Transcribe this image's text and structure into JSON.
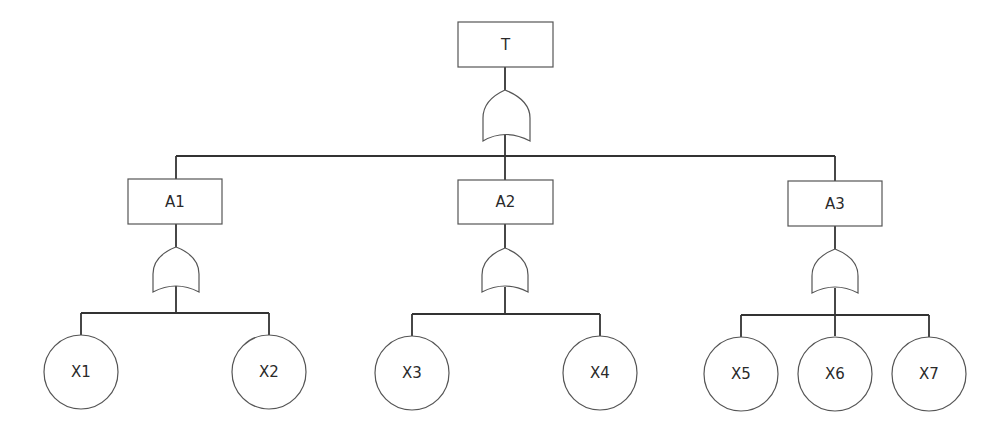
{
  "diagram": {
    "type": "fault-tree",
    "top_event": {
      "id": "T",
      "label": "T",
      "gate": "OR"
    },
    "intermediate_events": [
      {
        "id": "A1",
        "label": "A1",
        "gate": "OR",
        "children": [
          "X1",
          "X2"
        ]
      },
      {
        "id": "A2",
        "label": "A2",
        "gate": "OR",
        "children": [
          "X3",
          "X4"
        ]
      },
      {
        "id": "A3",
        "label": "A3",
        "gate": "OR",
        "children": [
          "X5",
          "X6",
          "X7"
        ]
      }
    ],
    "basic_events": [
      {
        "id": "X1",
        "label": "X1"
      },
      {
        "id": "X2",
        "label": "X2"
      },
      {
        "id": "X3",
        "label": "X3"
      },
      {
        "id": "X4",
        "label": "X4"
      },
      {
        "id": "X5",
        "label": "X5"
      },
      {
        "id": "X6",
        "label": "X6"
      },
      {
        "id": "X7",
        "label": "X7"
      }
    ],
    "line_color": "#333333",
    "shape_stroke_color": "#555555"
  }
}
